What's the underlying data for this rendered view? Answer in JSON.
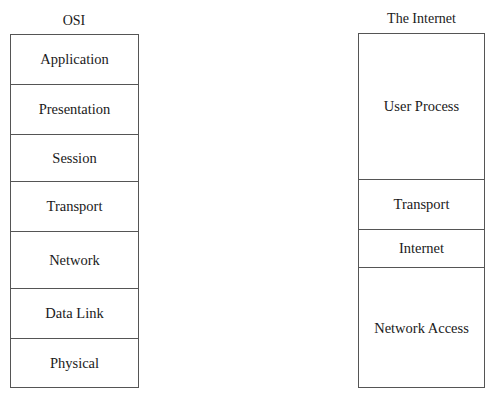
{
  "osi": {
    "title": "OSI",
    "layers": [
      "Application",
      "Presentation",
      "Session",
      "Transport",
      "Network",
      "Data Link",
      "Physical"
    ]
  },
  "internet": {
    "title": "The Internet",
    "layers": [
      "User Process",
      "Transport",
      "Internet",
      "Network Access"
    ]
  }
}
